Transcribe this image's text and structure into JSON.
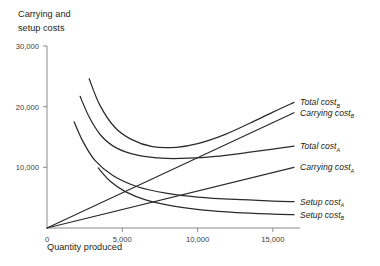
{
  "chart_data": {
    "type": "line",
    "title": "Carrying and setup costs",
    "xlabel": "Quantity produced",
    "ylabel": "Carrying and setup costs",
    "xlim": [
      0,
      16800
    ],
    "ylim": [
      0,
      30000
    ],
    "grid": false,
    "legend_position": "right-inline-labels",
    "xticks": [
      0,
      5000,
      10000,
      15000
    ],
    "xticklabels": [
      "0",
      "5,000",
      "10,000",
      "15,000"
    ],
    "yticks": [
      10000,
      20000,
      30000
    ],
    "yticklabels": [
      "10,000",
      "20,000",
      "30,000"
    ],
    "series": [
      {
        "name": "Total cost",
        "subscript": "B",
        "label_text": "Total cost",
        "shape": "u-curve",
        "x": [
          2800,
          3500,
          4500,
          5600,
          7000,
          8600,
          10000,
          11800,
          13500,
          15000,
          16400
        ],
        "values": [
          24600,
          20300,
          16600,
          14600,
          13400,
          13300,
          13900,
          15400,
          17300,
          19100,
          20700
        ]
      },
      {
        "name": "Carrying cost",
        "subscript": "B",
        "label_text": "Carrying cost",
        "shape": "line-from-origin",
        "x": [
          0,
          16400
        ],
        "values": [
          0,
          19000
        ]
      },
      {
        "name": "Total cost",
        "subscript": "A",
        "label_text": "Total cost",
        "shape": "u-curve",
        "x": [
          2200,
          2800,
          3600,
          4600,
          6000,
          7600,
          9400,
          11200,
          13200,
          15000,
          16400
        ],
        "values": [
          21700,
          18300,
          15200,
          13200,
          12000,
          11500,
          11500,
          11800,
          12400,
          13000,
          13500
        ]
      },
      {
        "name": "Carrying cost",
        "subscript": "A",
        "label_text": "Carrying cost",
        "shape": "line-from-origin",
        "x": [
          0,
          16400
        ],
        "values": [
          0,
          10000
        ]
      },
      {
        "name": "Setup cost",
        "subscript": "A",
        "label_text": "Setup cost",
        "shape": "decreasing-hyperbola",
        "x": [
          1800,
          2400,
          3200,
          4400,
          6000,
          8000,
          10000,
          12500,
          15000,
          16400
        ],
        "values": [
          17500,
          14200,
          11100,
          8600,
          6800,
          5700,
          5100,
          4700,
          4450,
          4350
        ]
      },
      {
        "name": "Setup cost",
        "subscript": "B",
        "label_text": "Setup cost",
        "shape": "decreasing-hyperbola",
        "x": [
          3400,
          4200,
          5200,
          6600,
          8400,
          10400,
          12600,
          15000,
          16400
        ],
        "values": [
          9900,
          7700,
          6000,
          4600,
          3600,
          2950,
          2550,
          2300,
          2200
        ]
      }
    ],
    "colors": {
      "curve": "#2b2b2b",
      "axis": "#8a8a8a",
      "text": "#231f20",
      "tick_text": "#3a3a3a",
      "background": "#ffffff"
    }
  }
}
